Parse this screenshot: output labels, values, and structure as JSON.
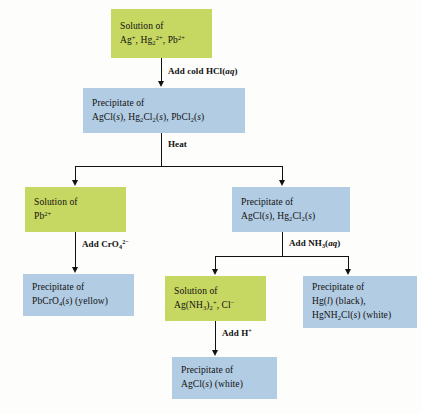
{
  "diagram": {
    "colors": {
      "solution_box": "#c6d762",
      "precipitate_box": "#b2cce3",
      "connector": "#111111",
      "background": "#fdfdfb"
    }
  },
  "boxes": {
    "start_solution": {
      "kind": "solution",
      "line1": "Solution of",
      "line2_html": "Ag<sup>+</sup>, Hg<sub>2</sub><sup>2+</sup>, Pb<sup>2+</sup>",
      "line2_text": "Ag+, Hg2 2+, Pb2+"
    },
    "chloride_precipitate": {
      "kind": "precipitate",
      "line1": "Precipitate of",
      "line2_html": "AgCl(<i>s</i>), Hg<sub>2</sub>Cl<sub>2</sub>(<i>s</i>), PbCl<sub>2</sub>(<i>s</i>)",
      "line2_text": "AgCl(s), Hg2Cl2(s), PbCl2(s)"
    },
    "lead_solution": {
      "kind": "solution",
      "line1": "Solution of",
      "line2_html": "Pb<sup>2+</sup>",
      "line2_text": "Pb2+"
    },
    "silver_mercury_precipitate": {
      "kind": "precipitate",
      "line1": "Precipitate of",
      "line2_html": "AgCl(<i>s</i>), Hg<sub>2</sub>Cl<sub>2</sub>(<i>s</i>)",
      "line2_text": "AgCl(s), Hg2Cl2(s)"
    },
    "lead_chromate_precipitate": {
      "kind": "precipitate",
      "line1": "Precipitate of",
      "line2_html": "PbCrO<sub>4</sub>(<i>s</i>) (yellow)",
      "line2_text": "PbCrO4(s) (yellow)"
    },
    "silver_ammine_solution": {
      "kind": "solution",
      "line1": "Solution of",
      "line2_html": "Ag(NH<sub>3</sub>)<sub>2</sub><sup>+</sup>, Cl<sup>&minus;</sup>",
      "line2_text": "Ag(NH3)2+, Cl-"
    },
    "mercury_precipitate": {
      "kind": "precipitate",
      "line1": "Precipitate of",
      "line2_html": "Hg(<i>l</i>) (black),",
      "line3_html": "HgNH<sub>2</sub>Cl(<i>s</i>) (white)",
      "line2_text": "Hg(l) (black),",
      "line3_text": "HgNH2Cl(s) (white)"
    },
    "silver_chloride_precipitate": {
      "kind": "precipitate",
      "line1": "Precipitate of",
      "line2_html": "AgCl(<i>s</i>) (white)",
      "line2_text": "AgCl(s) (white)"
    }
  },
  "reagents": {
    "add_hcl": {
      "label_html": "Add cold HCl(<i>aq</i>)",
      "label_text": "Add cold HCl(aq)"
    },
    "heat": {
      "label_html": "Heat",
      "label_text": "Heat"
    },
    "add_chromate": {
      "label_html": "Add CrO<sub>4</sub><sup>2&minus;</sup>",
      "label_text": "Add CrO4 2-"
    },
    "add_ammonia": {
      "label_html": "Add NH<sub>3</sub>(<i>aq</i>)",
      "label_text": "Add NH3(aq)"
    },
    "add_proton": {
      "label_html": "Add H<sup>+</sup>",
      "label_text": "Add H+"
    }
  }
}
